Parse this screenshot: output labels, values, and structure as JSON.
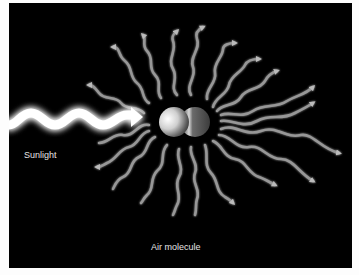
{
  "diagram": {
    "labels": {
      "sunlight": "Sunlight",
      "air_molecule": "Air molecule"
    },
    "colors": {
      "background": "#000000",
      "frame": "#fdfdfd",
      "incoming_light": "#ffffff",
      "scattered_light": "#b5b5b5",
      "label_text": "#e6e6e6"
    },
    "elements": {
      "incoming_wave": "sunlight-wave-arrow",
      "molecule": "diatomic-molecule",
      "scattered_waves_count": 22
    }
  }
}
